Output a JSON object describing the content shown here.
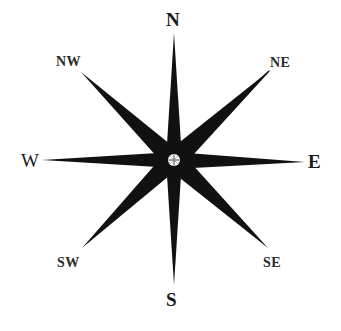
{
  "diagram": {
    "type": "compass-rose",
    "center": [
      174,
      160
    ],
    "colors": {
      "points": "#111111",
      "background": "#ffffff",
      "hub": "#ffffff"
    },
    "labels": {
      "n": "N",
      "ne": "NE",
      "e": "E",
      "se": "SE",
      "s": "S",
      "sw": "SW",
      "w": "W",
      "nw": "NW"
    }
  }
}
